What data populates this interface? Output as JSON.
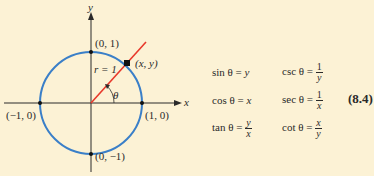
{
  "diagram": {
    "axes": {
      "x_label": "x",
      "y_label": "y"
    },
    "circle": {
      "color": "#3a7fc8",
      "radius_label": "r = 1"
    },
    "ray": {
      "color": "#e8392b",
      "angle_label": "θ"
    },
    "points": {
      "top": "(0, 1)",
      "bottom": "(0, −1)",
      "left": "(−1, 0)",
      "right": "(1, 0)",
      "terminal": "(x, y)"
    }
  },
  "formulas": {
    "sin": {
      "lhs": "sin θ = ",
      "rhs": "y"
    },
    "cos": {
      "lhs": "cos θ = ",
      "rhs": "x"
    },
    "tan": {
      "lhs": "tan θ = ",
      "num": "y",
      "den": "x"
    },
    "csc": {
      "lhs": "csc θ = ",
      "num": "1",
      "den": "y"
    },
    "sec": {
      "lhs": "sec θ = ",
      "num": "1",
      "den": "x"
    },
    "cot": {
      "lhs": "cot θ = ",
      "num": "x",
      "den": "y"
    },
    "equation_number": "(8.4)"
  },
  "colors": {
    "background": "#fcf2d5",
    "circle": "#3a7fc8",
    "ray": "#e8392b",
    "ink": "#2a2a2a"
  }
}
